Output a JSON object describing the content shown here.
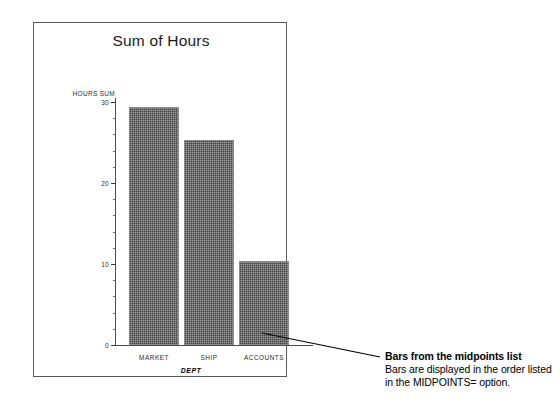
{
  "figure": {
    "frame_visible": true
  },
  "chart_data": {
    "type": "bar",
    "title": "Sum of Hours",
    "categories": [
      "MARKET",
      "SHIP",
      "ACCOUNTS"
    ],
    "values": [
      29.4,
      25.3,
      10.4
    ],
    "xlabel": "DEPT",
    "ylabel": "HOURS SUM",
    "ylim": [
      0,
      30
    ],
    "yticks": [
      0,
      10,
      20,
      30
    ],
    "ytick_labels": [
      "0",
      "10",
      "20",
      "30"
    ],
    "minor_tick_step": 2,
    "grid": false,
    "legend": null,
    "bar_color": "#9a9a9a",
    "axis_color": "#4d4d4d"
  },
  "callout": {
    "heading": "Bars from the midpoints list",
    "lines": [
      "Bars are displayed in the order listed",
      "in the MIDPOINTS= option."
    ],
    "leader_line": true
  }
}
